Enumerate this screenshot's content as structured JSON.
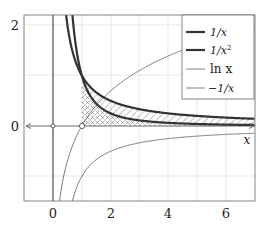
{
  "chart_data": {
    "type": "line",
    "title": "",
    "xlabel": "x",
    "ylabel": "",
    "xlim": [
      -1,
      7
    ],
    "ylim": [
      -1.5,
      2.2
    ],
    "grid": true,
    "x_ticks": [
      0,
      2,
      4,
      6
    ],
    "x_tick_labels": [
      "0",
      "2",
      "4",
      "6"
    ],
    "y_ticks": [
      0,
      2
    ],
    "y_tick_labels": [
      "0",
      "2"
    ],
    "legend_position": "upper right",
    "series": [
      {
        "name": "1/x",
        "function": "1/x",
        "style": "thick",
        "color": "#333333",
        "domain": [
          0.45,
          7
        ]
      },
      {
        "name": "1/x^2",
        "function": "1/x^2",
        "style": "thick",
        "color": "#333333",
        "domain": [
          0.67,
          7
        ]
      },
      {
        "name": "ln x",
        "function": "ln(x)",
        "style": "thin",
        "color": "#555555",
        "domain": [
          0.22,
          7
        ]
      },
      {
        "name": "−1/x",
        "function": "-1/x",
        "style": "thin",
        "color": "#555555",
        "domain": [
          0.67,
          7
        ]
      }
    ],
    "legend": [
      "1/x",
      "1/x²",
      "ln x",
      "−1/x"
    ],
    "annotations": [
      {
        "type": "open-circle",
        "x": 0,
        "y": 0
      },
      {
        "type": "open-circle",
        "x": 1,
        "y": 0
      },
      {
        "type": "hatched-region",
        "pattern": "cross-hatch",
        "between": [
          "y=0",
          "1/x^2"
        ],
        "x_from": 1,
        "x_to": 7
      },
      {
        "type": "hatched-region",
        "pattern": "diagonal",
        "between": [
          "1/x^2",
          "1/x"
        ],
        "x_from": 1,
        "x_to": 7
      }
    ]
  },
  "labels": {
    "xtick_0": "0",
    "xtick_2": "2",
    "xtick_4": "4",
    "xtick_6": "6",
    "ytick_0": "0",
    "ytick_2": "2",
    "xaxis_label": "x",
    "legend_1": "1/x",
    "legend_2a": "1/x",
    "legend_2sup": "2",
    "legend_3": "ln x",
    "legend_4": "−1/x"
  }
}
